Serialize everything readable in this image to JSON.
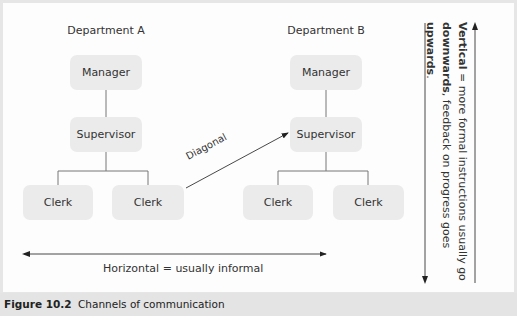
{
  "diagram": {
    "departments": [
      {
        "label": "Department A",
        "manager": "Manager",
        "supervisor": "Supervisor",
        "clerks": [
          "Clerk",
          "Clerk"
        ]
      },
      {
        "label": "Department B",
        "manager": "Manager",
        "supervisor": "Supervisor",
        "clerks": [
          "Clerk",
          "Clerk"
        ]
      }
    ],
    "diagonal_label": "Diagonal",
    "horizontal_label": "Horizontal =  usually informal",
    "vertical": {
      "bold1": "Vertical",
      "text1": " = more formal  instructions usually go",
      "bold2": "downwards",
      "text2": ", feedback on progress goes ",
      "bold3": "upwards",
      "text3": "."
    }
  },
  "caption": {
    "figure_number": "Figure 10.2",
    "title": "Channels of communication"
  },
  "colors": {
    "box_fill": "#ebebeb",
    "frame_border": "#e0e0e0",
    "caption_bg": "#e4e4e4",
    "line": "#555555"
  }
}
